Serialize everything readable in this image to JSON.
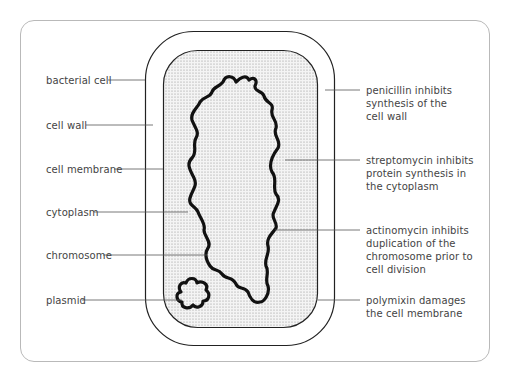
{
  "diagram": {
    "title": "",
    "colors": {
      "frame": "#b9b9b9",
      "outline": "#222222",
      "leader": "#555555",
      "text": "#444444",
      "cytoplasm_dots": "#9a9a9a",
      "cytoplasm_bg": "#f2f2f2"
    },
    "left_labels": [
      {
        "id": "bacterial-cell",
        "text": "bacterial cell"
      },
      {
        "id": "cell-wall",
        "text": "cell wall"
      },
      {
        "id": "cell-membrane",
        "text": "cell membrane"
      },
      {
        "id": "cytoplasm",
        "text": "cytoplasm"
      },
      {
        "id": "chromosome",
        "text": "chromosome"
      },
      {
        "id": "plasmid",
        "text": "plasmid"
      }
    ],
    "right_labels": [
      {
        "id": "penicillin",
        "lines": [
          "penicillin inhibits",
          "synthesis of the",
          "cell wall"
        ]
      },
      {
        "id": "streptomycin",
        "lines": [
          "streptomycin inhibits",
          "protein synthesis in",
          "the cytoplasm"
        ]
      },
      {
        "id": "actinomycin",
        "lines": [
          "actinomycin inhibits",
          "duplication of the",
          "chromosome prior to",
          "cell division"
        ]
      },
      {
        "id": "polymixin",
        "lines": [
          "polymixin damages",
          "the cell membrane"
        ]
      }
    ]
  }
}
